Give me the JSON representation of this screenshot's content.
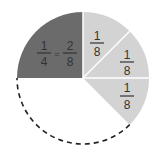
{
  "diagram": {
    "type": "fraction-circle",
    "colors": {
      "dark_slice": "#6b6b6b",
      "light_slice": "#d3d3d3",
      "divider": "#ffffff",
      "dashed_outline": "#222222",
      "text": "#333333"
    },
    "dark_slice": {
      "left_numerator": "1",
      "left_denominator": "4",
      "equals": "=",
      "right_numerator": "2",
      "right_denominator": "8"
    },
    "eighth_slices": [
      {
        "numerator": "1",
        "denominator": "8"
      },
      {
        "numerator": "1",
        "denominator": "8"
      },
      {
        "numerator": "1",
        "denominator": "8"
      }
    ]
  }
}
